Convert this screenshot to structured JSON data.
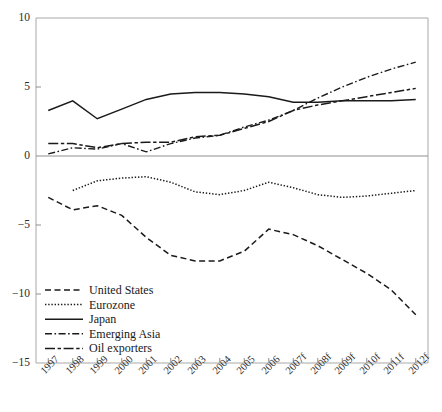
{
  "chart_data": {
    "type": "line",
    "title": "",
    "xlabel": "",
    "ylabel": "",
    "ylim": [
      -15,
      10
    ],
    "yticks": [
      10,
      5,
      0,
      -5,
      -10,
      -15
    ],
    "ytick_labels": [
      "10",
      "5",
      "0",
      "−5",
      "−10",
      "−15"
    ],
    "grid": false,
    "zero_line": true,
    "legend_position": "bottom-left",
    "categories": [
      "1997",
      "1998",
      "1999",
      "2000",
      "2001",
      "2002",
      "2003",
      "2004",
      "2005",
      "2006",
      "2007f",
      "2008f",
      "2009f",
      "2010f",
      "2011f",
      "2012f"
    ],
    "x": [
      "1997",
      "1998",
      "1999",
      "2000",
      "2001",
      "2002",
      "2003",
      "2004",
      "2005",
      "2006",
      "2007f",
      "2008f",
      "2009f",
      "2010f",
      "2011f",
      "2012f"
    ],
    "series": [
      {
        "name": "United States",
        "style": "dashed",
        "values": [
          -3.0,
          -3.9,
          -3.6,
          -4.3,
          -5.9,
          -7.2,
          -7.6,
          -7.6,
          -6.9,
          -5.3,
          -5.7,
          -6.5,
          -7.5,
          -8.5,
          -9.7,
          -11.5
        ]
      },
      {
        "name": "Eurozone",
        "style": "dotted",
        "values": [
          null,
          -2.5,
          -1.8,
          -1.6,
          -1.5,
          -1.9,
          -2.6,
          -2.8,
          -2.5,
          -1.9,
          -2.3,
          -2.8,
          -3.0,
          -2.9,
          -2.7,
          -2.5
        ]
      },
      {
        "name": "Japan",
        "style": "solid",
        "values": [
          3.3,
          4.0,
          2.7,
          3.4,
          4.1,
          4.5,
          4.6,
          4.6,
          4.5,
          4.3,
          3.9,
          3.9,
          4.0,
          4.0,
          4.0,
          4.1
        ]
      },
      {
        "name": "Emerging Asia",
        "style": "dashdot-fine",
        "values": [
          0.15,
          0.6,
          0.5,
          0.9,
          0.3,
          0.9,
          1.3,
          1.5,
          2.1,
          2.6,
          3.3,
          4.2,
          5.0,
          5.7,
          6.3,
          6.8
        ]
      },
      {
        "name": "Oil exporters",
        "style": "dashdot-long",
        "values": [
          0.9,
          0.9,
          0.6,
          0.9,
          1.0,
          1.0,
          1.4,
          1.5,
          2.0,
          2.5,
          3.3,
          3.7,
          4.0,
          4.3,
          4.6,
          4.9
        ]
      }
    ],
    "legend": [
      {
        "label": "United States",
        "style": "dashed"
      },
      {
        "label": "Eurozone",
        "style": "dotted"
      },
      {
        "label": "Japan",
        "style": "solid"
      },
      {
        "label": "Emerging Asia",
        "style": "dashdot-fine"
      },
      {
        "label": "Oil exporters",
        "style": "dashdot-long"
      }
    ]
  }
}
